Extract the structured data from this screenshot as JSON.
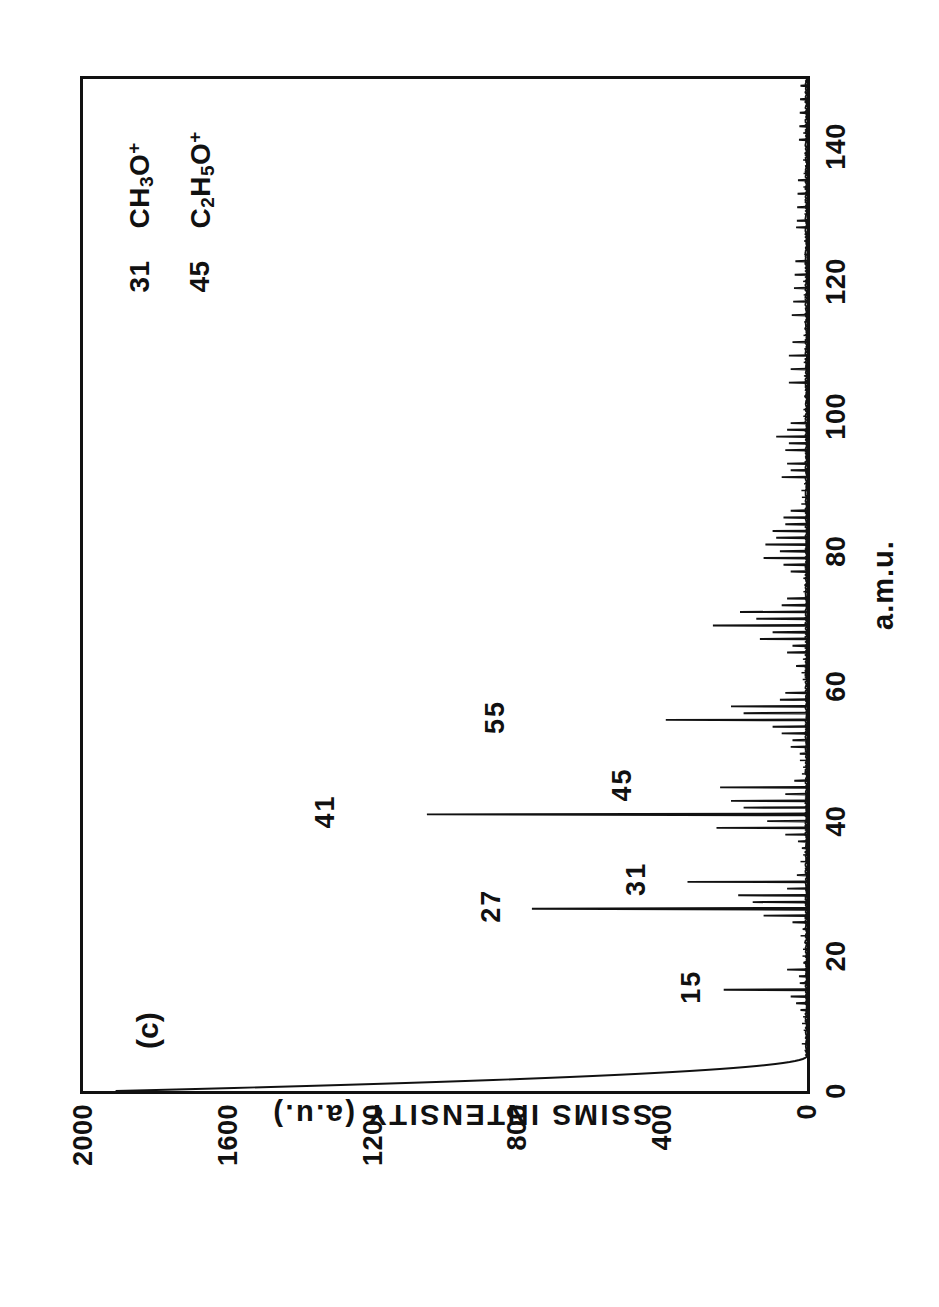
{
  "panel": {
    "label": "(c)"
  },
  "axes": {
    "x": {
      "title": "a.m.u.",
      "ticks": [
        0,
        20,
        40,
        60,
        80,
        100,
        120,
        140
      ],
      "min": 0,
      "max": 150
    },
    "y": {
      "title": "SSIMS INTENSITY (a.u.)",
      "ticks": [
        0,
        400,
        800,
        1200,
        1600,
        2000
      ],
      "min": 0,
      "max": 2000
    }
  },
  "legend": {
    "rows": [
      {
        "mass": "31",
        "formula_html": "CH<sub>3</sub>O<sup>+</sup>",
        "formula_text": "CH3O+"
      },
      {
        "mass": "45",
        "formula_html": "C<sub>2</sub>H<sub>5</sub>O<sup>+</sup>",
        "formula_text": "C2H5O+"
      }
    ]
  },
  "peak_annotations": [
    {
      "label": "15",
      "mass": 15,
      "y": 330
    },
    {
      "label": "27",
      "mass": 27,
      "y": 880
    },
    {
      "label": "31",
      "mass": 31,
      "y": 480
    },
    {
      "label": "41",
      "mass": 41,
      "y": 1340
    },
    {
      "label": "45",
      "mass": 45,
      "y": 520
    },
    {
      "label": "55",
      "mass": 55,
      "y": 870
    }
  ],
  "chart_data": {
    "type": "line",
    "title": "",
    "subtitle": "(c)",
    "xlabel": "a.m.u.",
    "ylabel": "SSIMS INTENSITY (a.u.)",
    "xlim": [
      0,
      150
    ],
    "ylim": [
      0,
      2000
    ],
    "xticks": [
      0,
      20,
      40,
      60,
      80,
      100,
      120,
      140
    ],
    "yticks": [
      0,
      400,
      800,
      1200,
      1600,
      2000
    ],
    "grid": false,
    "legend_position": "top-right",
    "annotations": [
      "15",
      "27",
      "31",
      "41",
      "45",
      "55",
      "31  CH3O+",
      "45  C2H5O+"
    ],
    "series": [
      {
        "name": "SSIMS spectrum",
        "description": "Static SIMS positive-ion mass spectrum; stick peaks at integer m/z with a rising low-mass tail below 5 a.m.u.",
        "x": [
          1,
          2,
          3,
          4,
          12,
          13,
          14,
          15,
          16,
          17,
          18,
          19,
          24,
          25,
          26,
          27,
          28,
          29,
          30,
          31,
          32,
          36,
          37,
          38,
          39,
          40,
          41,
          42,
          43,
          44,
          45,
          46,
          50,
          51,
          52,
          53,
          54,
          55,
          56,
          57,
          58,
          59,
          63,
          65,
          66,
          67,
          68,
          69,
          70,
          71,
          72,
          73,
          77,
          78,
          79,
          80,
          81,
          82,
          83,
          84,
          85,
          86,
          91,
          92,
          93,
          95,
          96,
          97,
          98,
          99,
          105,
          107,
          109,
          111,
          115,
          117,
          119,
          121,
          123,
          128,
          129,
          131,
          133,
          135,
          141,
          143,
          145,
          147,
          149
        ],
        "y": [
          130,
          70,
          40,
          25,
          18,
          30,
          45,
          230,
          20,
          22,
          55,
          10,
          12,
          40,
          120,
          760,
          150,
          190,
          55,
          330,
          28,
          14,
          25,
          60,
          250,
          110,
          1050,
          175,
          210,
          60,
          240,
          35,
          20,
          45,
          40,
          70,
          95,
          390,
          175,
          210,
          75,
          60,
          30,
          55,
          40,
          130,
          95,
          260,
          140,
          185,
          70,
          55,
          45,
          65,
          120,
          75,
          115,
          85,
          95,
          60,
          65,
          45,
          70,
          45,
          55,
          60,
          50,
          85,
          55,
          45,
          50,
          45,
          50,
          40,
          42,
          38,
          36,
          34,
          32,
          30,
          28,
          27,
          26,
          25,
          22,
          21,
          20,
          19,
          18
        ]
      }
    ]
  }
}
